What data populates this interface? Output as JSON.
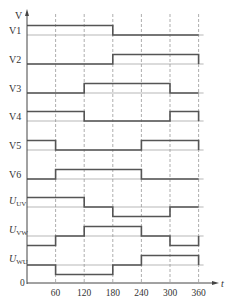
{
  "diagram": {
    "y_axis_label": "V",
    "x_axis_label": "t",
    "origin_label": "0",
    "x_ticks": [
      "60",
      "120",
      "180",
      "240",
      "300",
      "360"
    ],
    "signals": [
      {
        "label": "V1",
        "kind": "binary",
        "levels": [
          1,
          1,
          1,
          0,
          0,
          0
        ]
      },
      {
        "label": "V2",
        "kind": "binary",
        "levels": [
          0,
          0,
          0,
          1,
          1,
          1
        ]
      },
      {
        "label": "V3",
        "kind": "binary",
        "levels": [
          0,
          0,
          1,
          1,
          1,
          0
        ]
      },
      {
        "label": "V4",
        "kind": "binary",
        "levels": [
          1,
          1,
          0,
          0,
          0,
          1
        ]
      },
      {
        "label": "V5",
        "kind": "binary",
        "levels": [
          1,
          0,
          0,
          0,
          1,
          1
        ]
      },
      {
        "label": "V6",
        "kind": "binary",
        "levels": [
          0,
          1,
          1,
          1,
          0,
          0
        ]
      },
      {
        "label": "U",
        "subscript": "UV",
        "kind": "ternary",
        "levels": [
          1,
          1,
          0,
          -1,
          -1,
          0
        ]
      },
      {
        "label": "U",
        "subscript": "VW",
        "kind": "ternary",
        "levels": [
          -1,
          0,
          1,
          1,
          0,
          -1
        ]
      },
      {
        "label": "U",
        "subscript": "WU",
        "kind": "ternary",
        "levels": [
          0,
          -1,
          -1,
          0,
          1,
          1
        ]
      }
    ]
  },
  "colors": {
    "waveform": "#555555",
    "baseline": "#999999",
    "grid": "#777777",
    "text": "#333333"
  }
}
